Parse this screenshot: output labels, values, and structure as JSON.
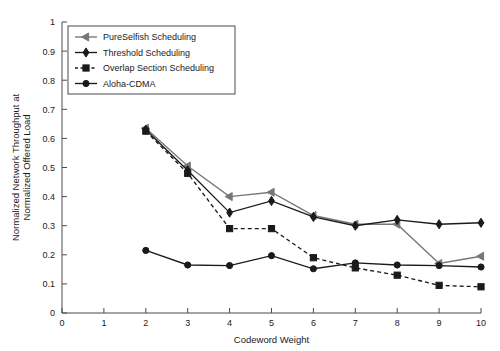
{
  "chart_data": {
    "type": "line",
    "title": "",
    "xlabel": "Codeword Weight",
    "ylabel": "Normalized Network Throughput at Normalized Offered Load",
    "ylabel_lines": [
      "Normalized Network Throughput at",
      "Normalized Offered Load"
    ],
    "xlim": [
      0,
      10
    ],
    "ylim": [
      0,
      1
    ],
    "xticks": [
      0,
      1,
      2,
      3,
      4,
      5,
      6,
      7,
      8,
      9,
      10
    ],
    "xticklabels": [
      "0",
      "1",
      "2",
      "3",
      "4",
      "5",
      "6",
      "7",
      "8",
      "9",
      "10"
    ],
    "yticks": [
      0,
      0.1,
      0.2,
      0.3,
      0.4,
      0.5,
      0.6,
      0.7,
      0.8,
      0.9,
      1
    ],
    "yticklabels": [
      "0",
      "0.1",
      "0.2",
      "0.3",
      "0.4",
      "0.5",
      "0.6",
      "0.7",
      "0.8",
      "0.9",
      "1"
    ],
    "grid": false,
    "legend_position": "upper-left",
    "x": [
      2,
      3,
      4,
      5,
      6,
      7,
      8,
      9,
      10
    ],
    "series": [
      {
        "name": "PureSelfish Scheduling",
        "marker": "left-arrow",
        "linestyle": "solid",
        "color": "#777777",
        "values": [
          0.635,
          0.505,
          0.4,
          0.415,
          0.335,
          0.305,
          0.305,
          0.17,
          0.195
        ]
      },
      {
        "name": "Threshold Scheduling",
        "marker": "diamond",
        "linestyle": "solid",
        "color": "#1a1a1a",
        "values": [
          0.63,
          0.49,
          0.345,
          0.385,
          0.33,
          0.3,
          0.32,
          0.305,
          0.31
        ]
      },
      {
        "name": "Overlap Section Scheduling",
        "marker": "square",
        "linestyle": "dashed",
        "color": "#1a1a1a",
        "values": [
          0.625,
          0.48,
          0.29,
          0.29,
          0.19,
          0.155,
          0.13,
          0.095,
          0.09
        ]
      },
      {
        "name": "Aloha-CDMA",
        "marker": "circle",
        "linestyle": "solid",
        "color": "#1a1a1a",
        "values": [
          0.215,
          0.165,
          0.163,
          0.197,
          0.152,
          0.172,
          0.165,
          0.163,
          0.158
        ]
      }
    ]
  }
}
